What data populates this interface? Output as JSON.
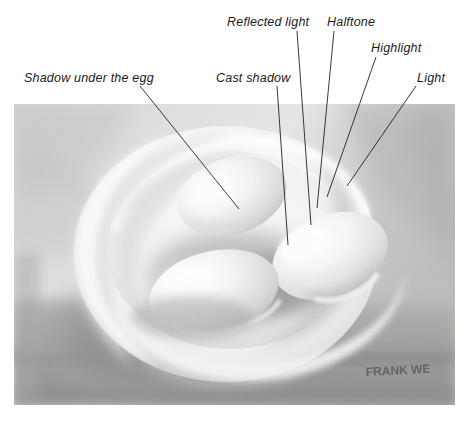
{
  "figure": {
    "medium": "watercolour / wash painting, greyscale",
    "signature": "FRANK WE"
  },
  "annotations": [
    {
      "id": "shadow-under-the-egg",
      "label": "Shadow under the egg",
      "text_x": 24,
      "text_y": 82,
      "line": {
        "x1": 140,
        "y1": 86,
        "x2": 239,
        "y2": 209
      }
    },
    {
      "id": "cast-shadow",
      "label": "Cast shadow",
      "text_x": 216,
      "text_y": 82,
      "line": {
        "x1": 277,
        "y1": 86,
        "x2": 288,
        "y2": 245
      }
    },
    {
      "id": "reflected-light",
      "label": "Reflected light",
      "text_x": 227,
      "text_y": 26,
      "line": {
        "x1": 297,
        "y1": 31,
        "x2": 311,
        "y2": 225
      }
    },
    {
      "id": "halftone",
      "label": "Halftone",
      "text_x": 327,
      "text_y": 26,
      "line": {
        "x1": 334,
        "y1": 31,
        "x2": 317,
        "y2": 208
      }
    },
    {
      "id": "highlight",
      "label": "Highlight",
      "text_x": 371,
      "text_y": 52,
      "line": {
        "x1": 376,
        "y1": 57,
        "x2": 327,
        "y2": 197
      }
    },
    {
      "id": "light",
      "label": "Light",
      "text_x": 417,
      "text_y": 82,
      "line": {
        "x1": 416,
        "y1": 86,
        "x2": 347,
        "y2": 186
      }
    }
  ],
  "colors": {
    "leader_line": "#222222",
    "label_text": "#1b1b1b",
    "page_background": "#ffffff",
    "paint_midtone": "#cfcfcd",
    "paint_shadow": "#9a9a99",
    "paint_deep_shadow": "#7c7c7b",
    "paint_highlight": "#fbfbfa",
    "bowl_white": "#f6f6f4"
  },
  "painting": {
    "bounds": {
      "left": 14,
      "top": 104,
      "width": 441,
      "height": 301
    },
    "subject": "three eggs resting inside a shallow white bowl on a table",
    "regions": [
      {
        "name": "background-upper-left",
        "tone": "light grey wash"
      },
      {
        "name": "background-upper-right",
        "tone": "mid grey wash"
      },
      {
        "name": "table-surface",
        "tone": "darker grey band across lower third"
      },
      {
        "name": "bowl-rim",
        "tone": "white with soft grey edge"
      },
      {
        "name": "bowl-interior",
        "tone": "near white"
      },
      {
        "name": "bowl-cast-shadow",
        "tone": "mid-dark grey falling to the left"
      },
      {
        "name": "egg-back-left",
        "tone": "light with soft halftone"
      },
      {
        "name": "egg-centre",
        "tone": "light with strong highlight"
      },
      {
        "name": "egg-front",
        "tone": "light with reflected light underneath"
      }
    ]
  }
}
